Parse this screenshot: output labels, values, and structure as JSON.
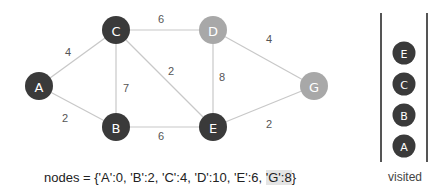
{
  "diagram": {
    "nodes": [
      {
        "id": "A",
        "x": 39,
        "y": 86,
        "state": "visited",
        "color": "#3a3a3a"
      },
      {
        "id": "B",
        "x": 116,
        "y": 127,
        "state": "visited",
        "color": "#3a3a3a"
      },
      {
        "id": "C",
        "x": 116,
        "y": 30,
        "state": "visited",
        "color": "#3a3a3a"
      },
      {
        "id": "D",
        "x": 213,
        "y": 30,
        "state": "unvisited",
        "color": "#a8a8a8"
      },
      {
        "id": "E",
        "x": 213,
        "y": 127,
        "state": "visited",
        "color": "#3a3a3a"
      },
      {
        "id": "G",
        "x": 314,
        "y": 86,
        "state": "unvisited",
        "color": "#a8a8a8"
      }
    ],
    "edges": [
      {
        "from": "A",
        "to": "C",
        "weight": "4",
        "lx": 68,
        "ly": 52
      },
      {
        "from": "A",
        "to": "B",
        "weight": "2",
        "lx": 65,
        "ly": 118
      },
      {
        "from": "C",
        "to": "D",
        "weight": "6",
        "lx": 161,
        "ly": 19
      },
      {
        "from": "C",
        "to": "B",
        "weight": "7",
        "lx": 126,
        "ly": 88
      },
      {
        "from": "C",
        "to": "E",
        "weight": "2",
        "lx": 171,
        "ly": 71
      },
      {
        "from": "B",
        "to": "E",
        "weight": "6",
        "lx": 161,
        "ly": 136
      },
      {
        "from": "D",
        "to": "E",
        "weight": "8",
        "lx": 222,
        "ly": 77
      },
      {
        "from": "D",
        "to": "G",
        "weight": "4",
        "lx": 269,
        "ly": 39
      },
      {
        "from": "E",
        "to": "G",
        "weight": "2",
        "lx": 269,
        "ly": 124
      }
    ],
    "edge_color": "#c8c8c8",
    "visited_color": "#3a3a3a",
    "unvisited_color": "#a8a8a8"
  },
  "caption": {
    "prefix": "nodes = {",
    "entries": [
      "'A':0, ",
      "'B':2, ",
      "'C':4, ",
      "'D':10, ",
      "'E':6, "
    ],
    "highlighted": "'G':8",
    "suffix": "}"
  },
  "visited_stack": {
    "label": "visited",
    "items_top_to_bottom": [
      "E",
      "C",
      "B",
      "A"
    ]
  }
}
